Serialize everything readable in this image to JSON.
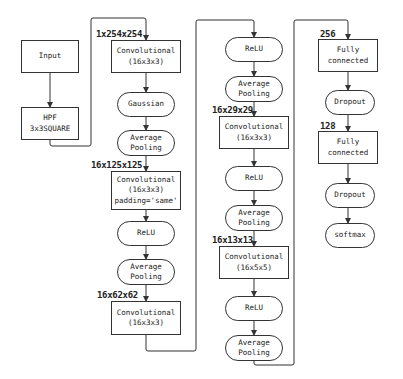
{
  "diagram": {
    "nodes": [
      {
        "id": "input",
        "shape": "rect",
        "lines": [
          "Input"
        ],
        "x": 21,
        "y": 40,
        "w": 58,
        "h": 33
      },
      {
        "id": "hpf",
        "shape": "rect",
        "lines": [
          "HPF",
          "3x3SQUARE"
        ],
        "x": 21,
        "y": 107,
        "w": 58,
        "h": 33
      },
      {
        "id": "conv1",
        "shape": "rect",
        "lines": [
          "Convolutional",
          "(16x3x3)"
        ],
        "x": 111,
        "y": 40,
        "w": 70,
        "h": 33
      },
      {
        "id": "gaussian",
        "shape": "pill",
        "lines": [
          "Gaussian"
        ],
        "x": 117,
        "y": 92,
        "w": 58,
        "h": 25
      },
      {
        "id": "avgpool1",
        "shape": "pill",
        "lines": [
          "Average",
          "Pooling"
        ],
        "x": 117,
        "y": 130,
        "w": 58,
        "h": 26
      },
      {
        "id": "conv2",
        "shape": "rect",
        "lines": [
          "Convolutional",
          "(16x3x3)",
          "padding='same'"
        ],
        "x": 111,
        "y": 171,
        "w": 70,
        "h": 39
      },
      {
        "id": "relu1",
        "shape": "pill",
        "lines": [
          "ReLU"
        ],
        "x": 117,
        "y": 221,
        "w": 58,
        "h": 25
      },
      {
        "id": "avgpool2",
        "shape": "pill",
        "lines": [
          "Average",
          "Pooling"
        ],
        "x": 117,
        "y": 259,
        "w": 58,
        "h": 26
      },
      {
        "id": "conv3",
        "shape": "rect",
        "lines": [
          "Convolutional",
          "(16x3x3)"
        ],
        "x": 111,
        "y": 301,
        "w": 70,
        "h": 34
      },
      {
        "id": "relu2",
        "shape": "pill",
        "lines": [
          "ReLU"
        ],
        "x": 225,
        "y": 37,
        "w": 58,
        "h": 25
      },
      {
        "id": "avgpool3",
        "shape": "pill",
        "lines": [
          "Average",
          "Pooling"
        ],
        "x": 225,
        "y": 76,
        "w": 58,
        "h": 26
      },
      {
        "id": "conv4",
        "shape": "rect",
        "lines": [
          "Convolutional",
          "(16x3x3)"
        ],
        "x": 219,
        "y": 116,
        "w": 70,
        "h": 33
      },
      {
        "id": "relu3",
        "shape": "pill",
        "lines": [
          "ReLU"
        ],
        "x": 225,
        "y": 166,
        "w": 58,
        "h": 25
      },
      {
        "id": "avgpool4",
        "shape": "pill",
        "lines": [
          "Average",
          "Pooling"
        ],
        "x": 225,
        "y": 205,
        "w": 58,
        "h": 26
      },
      {
        "id": "conv5",
        "shape": "rect",
        "lines": [
          "Convolutional",
          "(16x5x5)"
        ],
        "x": 219,
        "y": 246,
        "w": 70,
        "h": 33
      },
      {
        "id": "relu4",
        "shape": "pill",
        "lines": [
          "ReLU"
        ],
        "x": 225,
        "y": 296,
        "w": 58,
        "h": 25
      },
      {
        "id": "avgpool5",
        "shape": "pill",
        "lines": [
          "Average",
          "Pooling"
        ],
        "x": 225,
        "y": 335,
        "w": 58,
        "h": 26
      },
      {
        "id": "fc1",
        "shape": "rect",
        "lines": [
          "Fully",
          "connected"
        ],
        "x": 318,
        "y": 39,
        "w": 60,
        "h": 33
      },
      {
        "id": "dropout1",
        "shape": "pill",
        "lines": [
          "Dropout"
        ],
        "x": 325,
        "y": 90,
        "w": 50,
        "h": 25
      },
      {
        "id": "fc2",
        "shape": "rect",
        "lines": [
          "Fully",
          "connected"
        ],
        "x": 318,
        "y": 131,
        "w": 60,
        "h": 33
      },
      {
        "id": "dropout2",
        "shape": "pill",
        "lines": [
          "Dropout"
        ],
        "x": 325,
        "y": 183,
        "w": 50,
        "h": 25
      },
      {
        "id": "softmax",
        "shape": "pill",
        "lines": [
          "softmax"
        ],
        "x": 325,
        "y": 223,
        "w": 50,
        "h": 25
      }
    ],
    "labels": [
      {
        "id": "dim-1x254x254",
        "text": "1x254x254",
        "x": 96,
        "y": 29
      },
      {
        "id": "dim-16x125x125",
        "text": "16x125x125",
        "x": 91,
        "y": 160
      },
      {
        "id": "dim-16x62x62",
        "text": "16x62x62",
        "x": 97,
        "y": 290
      },
      {
        "id": "dim-16x29x29",
        "text": "16x29x29",
        "x": 212,
        "y": 105
      },
      {
        "id": "dim-16x13x13",
        "text": "16x13x13",
        "x": 212,
        "y": 235
      },
      {
        "id": "dim-256",
        "text": "256",
        "x": 320,
        "y": 29
      },
      {
        "id": "dim-128",
        "text": "128",
        "x": 320,
        "y": 121
      }
    ],
    "edges": [
      {
        "from": "input",
        "to": "hpf",
        "path": "M50,73 L50,107"
      },
      {
        "from": "hpf",
        "to": "conv1",
        "path": "M50,140 L50,144 Q50,146 52,146 L89,146 Q91,146 91,144 L91,20 Q91,18 93,18 L144,18 Q146,18 146,20 L146,40"
      },
      {
        "from": "conv1",
        "to": "gaussian",
        "path": "M146,73 L146,92"
      },
      {
        "from": "gaussian",
        "to": "avgpool1",
        "path": "M146,117 L146,130"
      },
      {
        "from": "avgpool1",
        "to": "conv2",
        "path": "M146,156 L146,171"
      },
      {
        "from": "conv2",
        "to": "relu1",
        "path": "M146,210 L146,221"
      },
      {
        "from": "relu1",
        "to": "avgpool2",
        "path": "M146,246 L146,259"
      },
      {
        "from": "avgpool2",
        "to": "conv3",
        "path": "M146,285 L146,301"
      },
      {
        "from": "conv3",
        "to": "relu2",
        "path": "M146,335 L146,349 Q146,351 148,351 L194,351 Q196,351 196,349 L196,22 Q196,20 198,20 L252,20 Q254,20 254,22 L254,37"
      },
      {
        "from": "relu2",
        "to": "avgpool3",
        "path": "M254,62 L254,76"
      },
      {
        "from": "avgpool3",
        "to": "conv4",
        "path": "M254,102 L254,116"
      },
      {
        "from": "conv4",
        "to": "relu3",
        "path": "M254,149 L254,166"
      },
      {
        "from": "relu3",
        "to": "avgpool4",
        "path": "M254,191 L254,205"
      },
      {
        "from": "avgpool4",
        "to": "conv5",
        "path": "M254,231 L254,246"
      },
      {
        "from": "conv5",
        "to": "relu4",
        "path": "M254,279 L254,296"
      },
      {
        "from": "relu4",
        "to": "avgpool5",
        "path": "M254,321 L254,335"
      },
      {
        "from": "avgpool5",
        "to": "fc1",
        "path": "M254,361 L254,363 Q254,365 256,365 L292,365 Q294,365 294,363 L294,22 Q294,20 296,20 L346,20 Q348,20 348,22 L348,39"
      },
      {
        "from": "fc1",
        "to": "dropout1",
        "path": "M348,72 L348,90"
      },
      {
        "from": "dropout1",
        "to": "fc2",
        "path": "M348,115 L348,131"
      },
      {
        "from": "fc2",
        "to": "dropout2",
        "path": "M348,164 L348,183"
      },
      {
        "from": "dropout2",
        "to": "softmax",
        "path": "M348,208 L348,223"
      }
    ],
    "colors": {
      "stroke": "#333333",
      "text": "#222222",
      "background": "#ffffff"
    }
  }
}
